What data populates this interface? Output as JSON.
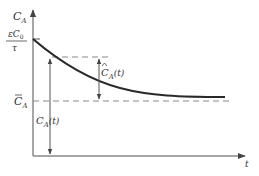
{
  "diagram": {
    "type": "concentration-vs-time",
    "y_axis_label": "C",
    "y_axis_label_sub": "A",
    "x_axis_label": "t",
    "initial_value_label": {
      "numerator": "εC",
      "numerator_sub": "0",
      "denominator": "τ"
    },
    "steady_state_label": {
      "text": "C",
      "sub": "A",
      "accent": "bar"
    },
    "deviation_label": {
      "text": "C",
      "sub": "A",
      "arg": "(t)",
      "accent": "hat"
    },
    "total_label": {
      "text": "C",
      "sub": "A",
      "arg": "(t)"
    },
    "colors": {
      "axis": "#777777",
      "curve": "#2a2a2a",
      "dashed": "#888888",
      "text": "#333333"
    }
  }
}
